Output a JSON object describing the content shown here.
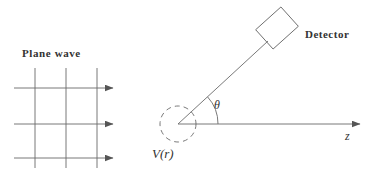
{
  "figure": {
    "kind": "scattering-diagram",
    "title": "",
    "background_color": "#ffffff",
    "stroke_color": "#555555",
    "text_color": "#333333",
    "width": 382,
    "height": 190
  },
  "labels": {
    "plane_wave": "Plane wave",
    "detector": "Detector",
    "potential": "V(r)",
    "theta": "θ",
    "z_axis": "z"
  },
  "plane_wave": {
    "label": "Plane wave",
    "wavefront_count": 3,
    "wavefront_x": [
      35,
      66,
      97
    ],
    "wavefront_y_top": [
      68,
      68,
      68
    ],
    "wavefront_y_bottom": [
      168,
      168,
      168
    ],
    "ray_count": 3,
    "ray_y": [
      88,
      124,
      158
    ],
    "ray_x_start": 14,
    "ray_x_end": 113,
    "direction": "rightward"
  },
  "scattering_center": {
    "label": "V(r)",
    "center_x": 178,
    "center_y": 124,
    "radius": 18,
    "line_style": "dashed",
    "dash_pattern": "5,4"
  },
  "z_axis": {
    "label": "z",
    "x_start": 178,
    "x_end": 360,
    "y": 124,
    "arrow": "right"
  },
  "scattered_ray": {
    "origin_x": 178,
    "origin_y": 124,
    "end_x": 268,
    "end_y": 41,
    "angle_label": "θ",
    "arc_radius": 40
  },
  "detector": {
    "label": "Detector",
    "center_x": 277,
    "center_y": 28,
    "box_width": 34,
    "box_height": 26,
    "rotation_deg": -42
  }
}
